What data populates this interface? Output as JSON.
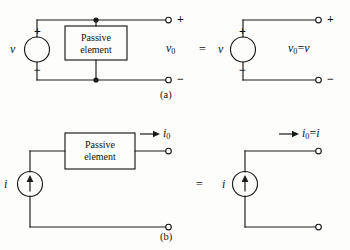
{
  "figure": {
    "title": "",
    "background_color": "#fdfdfc",
    "line_color": "#1a1a1a",
    "text_color": "#111111",
    "parts": [
      {
        "id": "a",
        "label": "(a)"
      },
      {
        "id": "b",
        "label": "(b)"
      }
    ]
  },
  "part_a": {
    "label": "(a)",
    "left_circuit": {
      "source": {
        "type": "voltage-source",
        "label": "v"
      },
      "polarity_plus": "+",
      "polarity_minus": "−",
      "element_box": {
        "line1": "Passive",
        "line2": "element"
      },
      "terminal_plus": "+",
      "terminal_minus": "−",
      "output_label": "v",
      "output_label_sub": "0"
    },
    "equals": "=",
    "right_circuit": {
      "source": {
        "type": "voltage-source",
        "label": "v"
      },
      "polarity_plus": "+",
      "polarity_minus": "−",
      "terminal_plus": "+",
      "terminal_minus": "−",
      "result_lhs": "v",
      "result_lhs_sub": "0",
      "result_eq": "=",
      "result_rhs": "v"
    }
  },
  "part_b": {
    "label": "(b)",
    "left_circuit": {
      "source": {
        "type": "current-source",
        "label": "i",
        "arrow_direction": "up"
      },
      "element_box": {
        "line1": "Passive",
        "line2": "element"
      },
      "current_label": "i",
      "current_label_sub": "0",
      "current_arrow_direction": "right"
    },
    "equals": "=",
    "right_circuit": {
      "source": {
        "type": "current-source",
        "label": "i",
        "arrow_direction": "up"
      },
      "result_lhs": "i",
      "result_lhs_sub": "0",
      "result_eq": "=",
      "result_rhs": "i",
      "current_arrow_direction": "right"
    }
  }
}
